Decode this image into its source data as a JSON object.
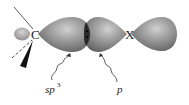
{
  "diagram": {
    "atoms": {
      "carbon": "C",
      "leaving_group": "X"
    },
    "labels": {
      "sp3_main": "sp",
      "sp3_sup": "3",
      "p": "p"
    },
    "colors": {
      "lobe_light": "#b5b5b5",
      "lobe_mid": "#8a8a8a",
      "lobe_dark": "#5e5e5e",
      "overlap": "#2a2a2a",
      "line": "#333333"
    }
  }
}
